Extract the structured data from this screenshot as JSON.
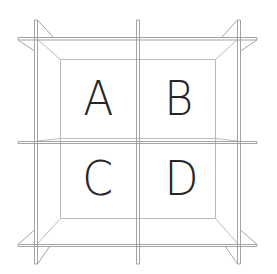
{
  "diagram": {
    "type": "2x2 cubby shelf line drawing",
    "line_color": "#9a9a9a",
    "text_color": "#262626",
    "background": "#ffffff",
    "compartments": [
      {
        "id": "top-left",
        "label": "A"
      },
      {
        "id": "top-right",
        "label": "B"
      },
      {
        "id": "bottom-left",
        "label": "C"
      },
      {
        "id": "bottom-right",
        "label": "D"
      }
    ]
  }
}
